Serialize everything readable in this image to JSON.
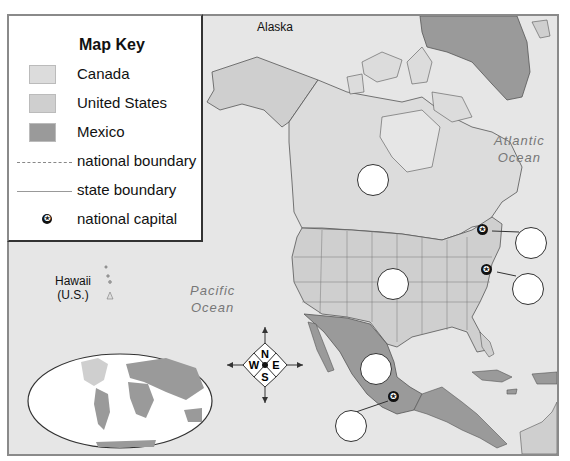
{
  "map": {
    "title": "North America",
    "colors": {
      "background_ocean": "#e6e6e6",
      "canada": "#dcdcdc",
      "united_states": "#cfcfcf",
      "mexico": "#9a9a9a",
      "other_land": "#9a9a9a",
      "capital": "#111111"
    },
    "labels": {
      "alaska": "Alaska",
      "hawaii_line1": "Hawaii",
      "hawaii_line2": "(U.S.)",
      "pacific_line1": "Pacific",
      "pacific_line2": "Ocean",
      "atlantic_line1": "Atlantic",
      "atlantic_line2": "Ocean"
    },
    "blank_circles": [
      {
        "id": "canada-blank",
        "x": 357,
        "y": 164
      },
      {
        "id": "us-blank",
        "x": 377,
        "y": 268
      },
      {
        "id": "mexico-blank",
        "x": 360,
        "y": 353
      },
      {
        "id": "ottawa-blank",
        "x": 517,
        "y": 230
      },
      {
        "id": "washington-blank",
        "x": 514,
        "y": 274
      },
      {
        "id": "mexico-city-blank",
        "x": 336,
        "y": 411
      }
    ],
    "capitals": [
      {
        "name": "Ottawa",
        "x": 482,
        "y": 230
      },
      {
        "name": "Washington, D.C.",
        "x": 487,
        "y": 270
      },
      {
        "name": "Mexico City",
        "x": 394,
        "y": 397
      }
    ]
  },
  "key": {
    "title": "Map Key",
    "items": [
      {
        "label": "Canada",
        "type": "swatch",
        "color": "#dcdcdc"
      },
      {
        "label": "United States",
        "type": "swatch",
        "color": "#cfcfcf"
      },
      {
        "label": "Mexico",
        "type": "swatch",
        "color": "#9a9a9a"
      },
      {
        "label": "national boundary",
        "type": "dash-line"
      },
      {
        "label": "state boundary",
        "type": "line"
      },
      {
        "label": "national capital",
        "type": "capital-star"
      }
    ]
  },
  "compass": {
    "n": "N",
    "s": "S",
    "e": "E",
    "w": "W"
  },
  "inset": {
    "name": "world-globe-inset"
  }
}
